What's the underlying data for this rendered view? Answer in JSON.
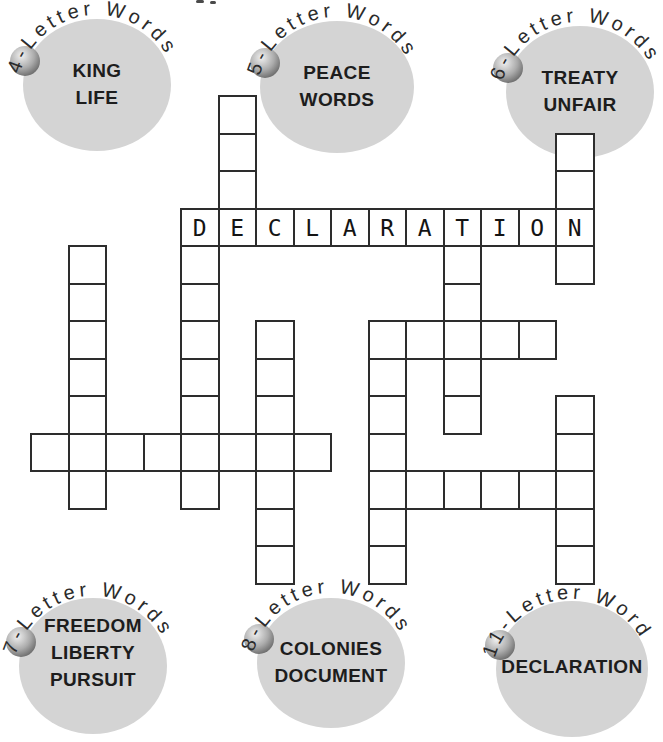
{
  "groups": [
    {
      "id": "4",
      "label": "4-Letter Words",
      "words_text": "KING\nLIFE"
    },
    {
      "id": "5",
      "label": "5-Letter Words",
      "words_text": "PEACE\nWORDS"
    },
    {
      "id": "6",
      "label": "6-Letter Words",
      "words_text": "TREATY\nUNFAIR"
    },
    {
      "id": "7",
      "label": "7-Letter Words",
      "words_text": "FREEDOM\nLIBERTY\nPURSUIT"
    },
    {
      "id": "8",
      "label": "8-Letter Words",
      "words_text": "COLONIES\nDOCUMENT"
    },
    {
      "id": "11",
      "label": "11-Letter Word",
      "words_text": "DECLARATION"
    }
  ],
  "puzzle": {
    "filled_entry": "DECLARATION",
    "words": [
      {
        "answer": "DECLARATION",
        "dir": "across",
        "col": 4,
        "row": 3,
        "letters_shown": true
      },
      {
        "answer": "LIFE",
        "dir": "down",
        "col": 5,
        "row": 0,
        "letters_shown": false
      },
      {
        "answer": "KING",
        "dir": "down",
        "col": 14,
        "row": 1,
        "letters_shown": false
      },
      {
        "answer": "DOCUMENT",
        "dir": "down",
        "col": 4,
        "row": 3,
        "letters_shown": false
      },
      {
        "answer": "TREATY",
        "dir": "down",
        "col": 11,
        "row": 3,
        "letters_shown": false
      },
      {
        "answer": "PEACE",
        "dir": "across",
        "col": 9,
        "row": 6,
        "letters_shown": false
      },
      {
        "answer": "PURSUIT",
        "dir": "down",
        "col": 9,
        "row": 6,
        "letters_shown": false
      },
      {
        "answer": "LIBERTY",
        "dir": "down",
        "col": 6,
        "row": 6,
        "letters_shown": false
      },
      {
        "answer": "FREEDOM",
        "dir": "down",
        "col": 1,
        "row": 4,
        "letters_shown": false
      },
      {
        "answer": "COLONIES",
        "dir": "across",
        "col": 0,
        "row": 9,
        "letters_shown": false
      },
      {
        "answer": "UNFAIR",
        "dir": "across",
        "col": 9,
        "row": 10,
        "letters_shown": false
      },
      {
        "answer": "WORDS",
        "dir": "down",
        "col": 14,
        "row": 8,
        "letters_shown": false
      }
    ]
  },
  "colors": {
    "circle_fill": "#d4d4d4",
    "grid_line": "#2d2d2d",
    "text": "#1d1d1d",
    "ball_highlight": "#f0f0f0",
    "ball_shadow": "#5e5e5e"
  }
}
